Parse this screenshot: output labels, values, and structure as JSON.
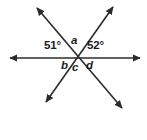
{
  "figure": {
    "canvas": {
      "width": 147,
      "height": 140,
      "background": "#ffffff"
    },
    "stroke_color": "#2b2b2b",
    "text_color": "#1b1b1b",
    "intersection": {
      "x": 76,
      "y": 58
    },
    "lines": [
      {
        "name": "horizontal-line",
        "x1": 10,
        "y1": 58,
        "x2": 140,
        "y2": 58,
        "arrow_start": true,
        "arrow_end": true
      },
      {
        "name": "diagonal-line-nw-se",
        "x1": 37,
        "y1": 8,
        "x2": 122,
        "y2": 108,
        "arrow_start": true,
        "arrow_end": true
      },
      {
        "name": "diagonal-line-ne-sw",
        "x1": 113,
        "y1": 7,
        "x2": 46,
        "y2": 102,
        "arrow_start": true,
        "arrow_end": true
      }
    ],
    "labels": {
      "angle_left": "51°",
      "angle_right": "52°",
      "var_a": "a",
      "var_b": "b",
      "var_c": "c",
      "var_d": "d"
    }
  },
  "chart_data": {
    "type": "diagram",
    "known_angles": [
      {
        "label": "51°",
        "value": 51,
        "unit": "degrees",
        "position": "upper-left, between horizontal ray and upper-left diagonal ray"
      },
      {
        "label": "52°",
        "value": 52,
        "unit": "degrees",
        "position": "upper-right, between upper-right diagonal ray and horizontal ray"
      }
    ],
    "unknown_angles": [
      {
        "label": "a",
        "position": "top, between the two upper diagonal rays"
      },
      {
        "label": "b",
        "position": "lower-left, between left horizontal ray and lower-left diagonal ray"
      },
      {
        "label": "c",
        "position": "bottom, between the two lower diagonal rays"
      },
      {
        "label": "d",
        "position": "lower-right, between lower-right diagonal ray and right horizontal ray"
      }
    ]
  }
}
